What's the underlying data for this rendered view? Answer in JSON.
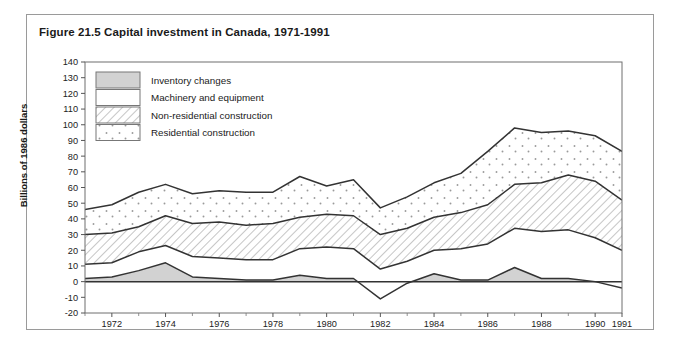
{
  "figure": {
    "title": "Figure 21.5 Capital investment in Canada, 1971-1991"
  },
  "axes": {
    "ylabel": "Billions of 1986 dollars",
    "ytick_labels": [
      "140",
      "130",
      "120",
      "110",
      "100",
      "90",
      "80",
      "70",
      "60",
      "50",
      "40",
      "30",
      "20",
      "10",
      "0",
      "-10",
      "-20"
    ],
    "xtick_labels": [
      "1972",
      "1974",
      "1976",
      "1978",
      "1980",
      "1982",
      "1984",
      "1986",
      "1988",
      "1990",
      "1991"
    ]
  },
  "legend": {
    "items": [
      {
        "label": "Inventory changes",
        "swatch": "solid-gray"
      },
      {
        "label": "Machinery and equipment",
        "swatch": "white"
      },
      {
        "label": "Non-residential construction",
        "swatch": "diagonal-hatch"
      },
      {
        "label": "Residential construction",
        "swatch": "stipple-dots"
      }
    ]
  },
  "chart_data": {
    "type": "area",
    "stacked": true,
    "title": "Figure 21.5 Capital investment in Canada, 1971-1991",
    "xlabel": "",
    "ylabel": "Billions of 1986 dollars",
    "ylim": [
      -20,
      140
    ],
    "xlim": [
      1971,
      1991
    ],
    "ytick_step": 10,
    "grid": false,
    "legend_position": "upper-left-inside",
    "x": [
      1971,
      1972,
      1973,
      1974,
      1975,
      1976,
      1977,
      1978,
      1979,
      1980,
      1981,
      1982,
      1983,
      1984,
      1985,
      1986,
      1987,
      1988,
      1989,
      1990,
      1991
    ],
    "series": [
      {
        "name": "Inventory changes",
        "fill": "solid-gray",
        "values": [
          2,
          3,
          7,
          12,
          3,
          2,
          1,
          1,
          4,
          2,
          2,
          -11,
          -1,
          5,
          1,
          1,
          9,
          2,
          2,
          0,
          -4
        ]
      },
      {
        "name": "Machinery and equipment",
        "fill": "white",
        "values": [
          9,
          9,
          12,
          11,
          13,
          13,
          13,
          13,
          17,
          20,
          19,
          19,
          14,
          15,
          20,
          23,
          25,
          30,
          31,
          28,
          24
        ]
      },
      {
        "name": "Non-residential construction",
        "fill": "diagonal-hatch",
        "values": [
          19,
          19,
          16,
          19,
          21,
          23,
          22,
          23,
          20,
          21,
          21,
          22,
          21,
          21,
          23,
          25,
          28,
          31,
          35,
          36,
          32
        ]
      },
      {
        "name": "Residential construction",
        "fill": "stipple-dots",
        "values": [
          16,
          18,
          22,
          20,
          19,
          20,
          21,
          20,
          26,
          18,
          23,
          17,
          20,
          22,
          25,
          34,
          36,
          32,
          28,
          29,
          31
        ]
      }
    ],
    "cumulative_boundaries": {
      "note": "Stacked cumulative top of each band, in billions of 1986 dollars",
      "inventory_top": [
        2,
        3,
        7,
        12,
        3,
        2,
        1,
        1,
        4,
        2,
        2,
        -11,
        -1,
        5,
        1,
        1,
        9,
        2,
        2,
        0,
        -4
      ],
      "machinery_top": [
        11,
        12,
        19,
        23,
        16,
        15,
        14,
        14,
        21,
        22,
        21,
        8,
        13,
        20,
        21,
        24,
        34,
        32,
        33,
        28,
        20
      ],
      "nonres_top": [
        30,
        31,
        35,
        42,
        37,
        38,
        36,
        37,
        41,
        43,
        42,
        30,
        34,
        41,
        44,
        49,
        62,
        63,
        68,
        64,
        52
      ],
      "total_top": [
        46,
        49,
        57,
        62,
        56,
        58,
        57,
        57,
        67,
        61,
        65,
        47,
        54,
        63,
        69,
        83,
        98,
        95,
        96,
        93,
        83
      ]
    }
  },
  "plot_geometry": {
    "x0": 85,
    "x1": 622,
    "y_top": 62,
    "y_bottom": 313,
    "v_min": -20,
    "v_max": 140
  }
}
